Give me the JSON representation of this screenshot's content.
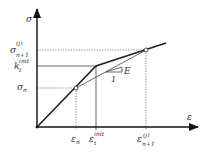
{
  "diagram": {
    "type": "stress-strain bilinear constitutive diagram",
    "axes": {
      "y_label": "σ",
      "x_label": "ε"
    },
    "y_levels": [
      {
        "id": "sigma_n1_j",
        "base": "σ",
        "sub": "n+1",
        "sup": "(j)",
        "line": "dotted"
      },
      {
        "id": "k_t_init",
        "base": "k",
        "sub": "t",
        "sup": "init",
        "line": "solid"
      },
      {
        "id": "sigma_n",
        "base": "σ",
        "sub": "n",
        "sup": "",
        "line": "dotted"
      }
    ],
    "x_levels": [
      {
        "id": "eps_n",
        "base": "ε",
        "sub": "n",
        "sup": "",
        "line": "dotted"
      },
      {
        "id": "eps_t_init",
        "base": "ε",
        "sub": "t",
        "sup": "init",
        "line": "solid"
      },
      {
        "id": "eps_n1_j",
        "base": "ε",
        "sub": "n+1",
        "sup": "(j)",
        "line": "dotted"
      }
    ],
    "slope_triangle": {
      "run_label": "1",
      "rise_label": "E"
    },
    "colors": {
      "curve": "#222222",
      "axis": "#111111",
      "guide": "#555555",
      "text": "#333333"
    }
  }
}
